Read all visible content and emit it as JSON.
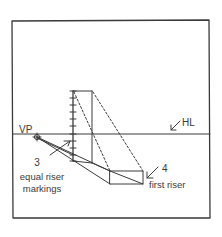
{
  "diagram": {
    "labels": {
      "vp": "VP",
      "hl": "HL",
      "step3_number": "3",
      "step3_line1": "equal riser",
      "step3_line2": "markings",
      "step4_number": "4",
      "step4_line1": "first riser"
    },
    "colors": {
      "ink": "#3a3a3a",
      "background": "#ffffff"
    },
    "elements": {
      "frame": {
        "x": 12,
        "y": 20,
        "width": 198,
        "height": 198
      },
      "horizon_line_y": 134,
      "vanishing_point": {
        "x": 37,
        "y": 137
      },
      "marked_vertical": {
        "x": 73,
        "y_top": 91,
        "y_bottom": 161,
        "tick_count": 10
      },
      "back_vertical": {
        "x": 92,
        "y_top": 91,
        "y_bottom": 163
      },
      "first_riser_box": {
        "x1": 110,
        "y1": 171,
        "x2": 143,
        "y2": 184
      }
    }
  }
}
